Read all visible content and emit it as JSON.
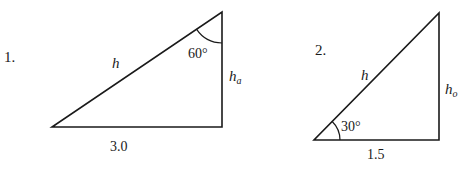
{
  "diagram": {
    "colors": {
      "stroke": "#1a1a1a",
      "background": "#ffffff"
    },
    "triangles": [
      {
        "number": "1.",
        "hypotenuse_label": "h",
        "vertical_side_label": "h",
        "vertical_side_subscript": "a",
        "base_label": "3.0",
        "angle_label": "60°",
        "angle_location": "top vertex"
      },
      {
        "number": "2.",
        "hypotenuse_label": "h",
        "vertical_side_label": "h",
        "vertical_side_subscript": "o",
        "base_label": "1.5",
        "angle_label": "30°",
        "angle_location": "bottom-left vertex"
      }
    ]
  }
}
